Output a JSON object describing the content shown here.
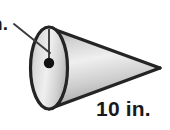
{
  "figure": {
    "kind": "cone-diagram",
    "labels": {
      "radius_label": "n.",
      "radius_label_full": "in.",
      "slant_label": "10 in."
    },
    "icons": {
      "center_point": "center-point-dot",
      "radius_segment": "radius-line",
      "leader": "leader-line"
    },
    "measurements": {
      "slant_or_height_value": "10",
      "slant_or_height_unit": "in.",
      "radius_unit": "in."
    },
    "colors": {
      "outline": "#242424",
      "body_light": "#f2f2f2",
      "body_mid": "#c9c9c9",
      "body_dark": "#a8a8a8",
      "base_light": "#ededed",
      "base_mid": "#cfcfcf",
      "base_dark": "#b3b3b3",
      "point_fill": "#111111",
      "background": "#ffffff",
      "text": "#1a1a1a"
    }
  }
}
